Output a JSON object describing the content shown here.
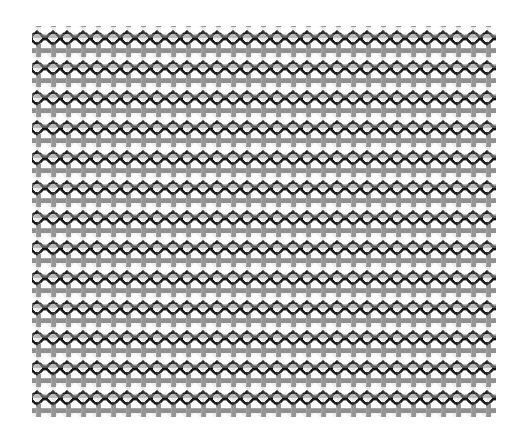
{
  "image": {
    "kind": "texture-swatch",
    "subject": "woven wire mesh / chain-link fabric texture",
    "width": 520,
    "height": 440,
    "background_color": "#ffffff"
  },
  "pattern": {
    "name": "crimped-woven-mesh",
    "region": {
      "x": 32,
      "y": 26,
      "width": 464,
      "height": 391
    },
    "tile": {
      "period_x": 30,
      "period_y": 30
    },
    "counts": {
      "columns": 16,
      "rows": 13
    },
    "colors": {
      "background": "#ffffff",
      "warp_gray": "#8f8f8f",
      "warp_gray_dark": "#7c7c7c",
      "weft_dark": "#1c1c1c",
      "cell_fill": "#ededed",
      "cell_fill_alt": "#f4f4f4",
      "edge_soft": "#b4b4b4"
    },
    "elements": {
      "horizontal_bar_label": "gray warp bar",
      "vertical_tick_label": "gray warp tick",
      "lens_label": "dark weft lens link",
      "lens_width": 30,
      "lens_height": 15,
      "bar_thickness": 5,
      "tick_thickness": 5,
      "tick_height": 13,
      "strand_thickness": 2.6
    }
  },
  "chart_data": {
    "type": "heatmap",
    "xlabel": "",
    "ylabel": "",
    "grid": true,
    "legend": "none",
    "categories": [],
    "values": []
  }
}
